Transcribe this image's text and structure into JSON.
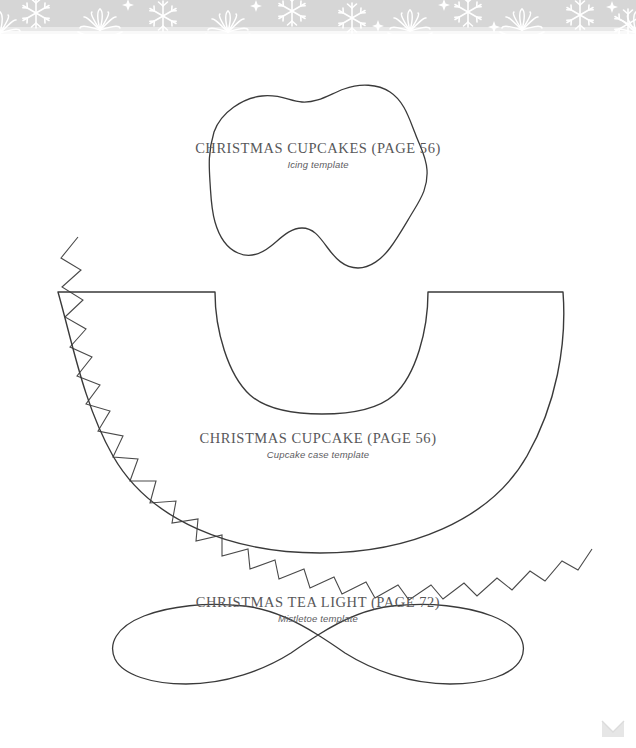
{
  "page": {
    "background_color": "#ffffff",
    "width": 636,
    "height": 748,
    "ink_color": "#3a3a3a",
    "text_color": "#58585a",
    "band_color": "#d6d6d6",
    "band_motif": "snowflake-border"
  },
  "templates": [
    {
      "id": "icing",
      "shape": "icing-blob",
      "title": "CHRISTMAS CUPCAKES (PAGE 56)",
      "subtitle": "Icing template"
    },
    {
      "id": "cupcake-case",
      "shape": "zigzag-fan-arc",
      "title": "CHRISTMAS CUPCAKE (PAGE 56)",
      "subtitle": "Cupcake case template"
    },
    {
      "id": "tea-light",
      "shape": "mistletoe-leaf-pair",
      "title": "CHRISTMAS TEA LIGHT (PAGE 72)",
      "subtitle": "Mistletoe template"
    }
  ],
  "corner_mark": {
    "icon": "chevron-mark-icon",
    "color": "#e2e2e2"
  }
}
